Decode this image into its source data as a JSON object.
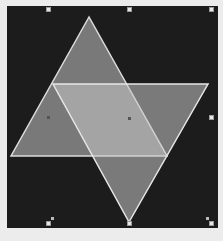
{
  "canvas": {
    "background": "#1c1c1c",
    "frame_color": "#ececec"
  },
  "shapes": [
    {
      "name": "upward-triangle",
      "type": "triangle",
      "points": "89,17 11,156 167,156",
      "fill": "#b8b8b8",
      "fill_opacity": 0.6,
      "stroke": "#dcdcdc"
    },
    {
      "name": "downward-triangle",
      "type": "triangle",
      "points": "53,84 208,84 129,222",
      "fill": "#c8c8c8",
      "fill_opacity": 0.55,
      "stroke": "#e6e6e6"
    }
  ],
  "selection_handles": [
    {
      "x": 48,
      "y": 9
    },
    {
      "x": 129,
      "y": 9
    },
    {
      "x": 211,
      "y": 9
    },
    {
      "x": 211,
      "y": 117
    },
    {
      "x": 211,
      "y": 223
    },
    {
      "x": 129,
      "y": 223
    },
    {
      "x": 48,
      "y": 223
    }
  ],
  "center_markers": [
    {
      "x": 48,
      "y": 117
    },
    {
      "x": 129,
      "y": 118
    }
  ],
  "rotation_handles": [
    {
      "x": 52,
      "y": 218
    },
    {
      "x": 207,
      "y": 218
    }
  ]
}
